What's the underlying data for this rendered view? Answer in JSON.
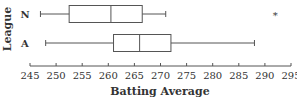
{
  "chart_data": {
    "type": "boxplot",
    "orientation": "horizontal",
    "title": "",
    "xlabel": "Batting Average",
    "ylabel": "League",
    "xlim": [
      245,
      295
    ],
    "xticks": [
      245,
      250,
      255,
      260,
      265,
      270,
      275,
      280,
      285,
      290,
      295
    ],
    "xtick_labels": [
      "245",
      "250",
      "255",
      "260",
      "265",
      "270",
      "275",
      "280",
      "285",
      "290",
      "295"
    ],
    "categories": [
      "N",
      "A"
    ],
    "series": [
      {
        "name": "N",
        "whisker_low": 247,
        "q1": 252.5,
        "median": 260.5,
        "q3": 266.5,
        "whisker_high": 271,
        "outliers": [
          292
        ]
      },
      {
        "name": "A",
        "whisker_low": 248,
        "q1": 261,
        "median": 266,
        "q3": 272,
        "whisker_high": 288,
        "outliers": []
      }
    ],
    "outlier_marker": "*",
    "grid": false,
    "legend": "none"
  },
  "colors": {
    "line": "#555555",
    "text": "#333333",
    "background": "#ffffff"
  }
}
